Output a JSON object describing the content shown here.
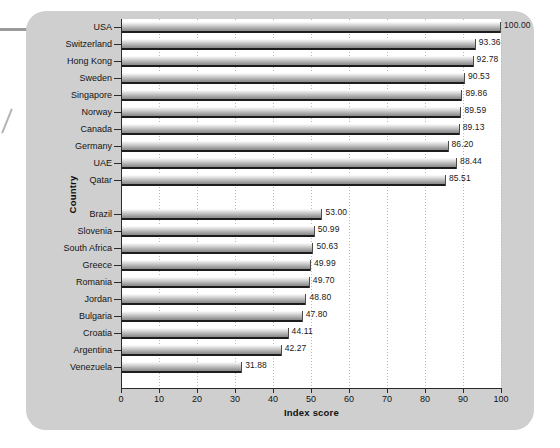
{
  "chart_data": {
    "type": "bar",
    "orientation": "horizontal",
    "title": "",
    "xlabel": "Index score",
    "ylabel": "Country",
    "xlim": [
      0,
      100
    ],
    "xticks": [
      "0",
      "10",
      "20",
      "30",
      "40",
      "50",
      "60",
      "70",
      "80",
      "90",
      "100"
    ],
    "grid": "vertical-dotted",
    "legend": "none",
    "groups": [
      {
        "name": "top",
        "categories": [
          "USA",
          "Switzerland",
          "Hong Kong",
          "Sweden",
          "Singapore",
          "Norway",
          "Canada",
          "Germany",
          "UAE",
          "Qatar"
        ],
        "values": [
          100.0,
          93.36,
          92.78,
          90.53,
          89.86,
          89.59,
          89.13,
          86.2,
          88.44,
          85.51
        ],
        "labels": [
          "100.00",
          "93.36",
          "92.78",
          "90.53",
          "89.86",
          "89.59",
          "89.13",
          "86.20",
          "88.44",
          "85.51"
        ]
      },
      {
        "name": "bottom",
        "categories": [
          "Brazil",
          "Slovenia",
          "South Africa",
          "Greece",
          "Romania",
          "Jordan",
          "Bulgaria",
          "Croatia",
          "Argentina",
          "Venezuela"
        ],
        "values": [
          53.0,
          50.99,
          50.63,
          49.99,
          49.7,
          48.8,
          47.8,
          44.11,
          42.27,
          31.88
        ],
        "labels": [
          "53.00",
          "50.99",
          "50.63",
          "49.99",
          "49.70",
          "48.80",
          "47.80",
          "44.11",
          "42.27",
          "31.88"
        ]
      }
    ]
  },
  "style": {
    "card_bg": "#cfcfcf",
    "plot_bg": "#ffffff",
    "axis_color": "#2a2a2a",
    "bar_edge": "#1d1d1d",
    "text_color": "#141414"
  }
}
